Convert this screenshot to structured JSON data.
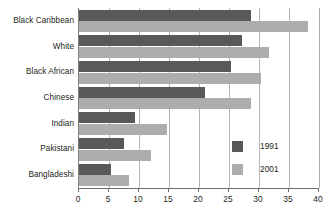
{
  "chart_data": {
    "type": "bar",
    "orientation": "horizontal",
    "title": "",
    "subtitle": "",
    "xlabel": "",
    "ylabel": "",
    "xlim": [
      0,
      40
    ],
    "xticks": [
      0,
      5,
      10,
      15,
      20,
      25,
      30,
      35,
      40
    ],
    "xtick_labels": [
      "0",
      "5",
      "10",
      "15",
      "20",
      "25",
      "30",
      "35",
      "40"
    ],
    "grid": true,
    "grid_axis": "x",
    "legend_position": "bottom-right-inside",
    "categories": [
      "Black Caribbean",
      "White",
      "Black African",
      "Chinese",
      "Indian",
      "Pakistani",
      "Bangladeshi"
    ],
    "series": [
      {
        "name": "1991",
        "color": "#595959",
        "values": [
          28.7,
          27.2,
          25.3,
          21.0,
          9.4,
          7.5,
          5.3
        ]
      },
      {
        "name": "2001",
        "color": "#adadad",
        "values": [
          38.2,
          31.7,
          30.3,
          28.6,
          14.7,
          12.0,
          8.3
        ]
      }
    ]
  },
  "legend": {
    "items": [
      {
        "label": "1991",
        "color": "#595959"
      },
      {
        "label": "2001",
        "color": "#adadad"
      }
    ]
  },
  "colors": {
    "series_1991": "#595959",
    "series_2001": "#adadad",
    "gridline": "#b5b5b5",
    "axis": "#6e6e6e",
    "text": "#231f20",
    "background": "#ffffff"
  }
}
